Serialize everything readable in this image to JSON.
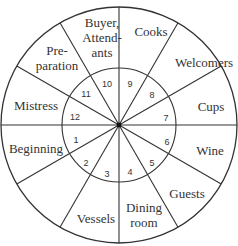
{
  "diagram": {
    "center": [
      119,
      125
    ],
    "outer_radius": 118,
    "inner_radius": 57,
    "line_color": "#333333",
    "sectors": [
      {
        "number": "1",
        "label": [
          "Beginning"
        ]
      },
      {
        "number": "2",
        "label": [
          "Vessels"
        ]
      },
      {
        "number": "3",
        "label": [
          ""
        ]
      },
      {
        "number": "4",
        "label": [
          "Dining",
          "room"
        ]
      },
      {
        "number": "5",
        "label": [
          "Guests"
        ]
      },
      {
        "number": "6",
        "label": [
          "Wine"
        ]
      },
      {
        "number": "7",
        "label": [
          "Cups"
        ]
      },
      {
        "number": "8",
        "label": [
          "Welcomers"
        ]
      },
      {
        "number": "9",
        "label": [
          "Cooks"
        ]
      },
      {
        "number": "10",
        "label": [
          "Buyer,",
          "Attend-",
          "ants"
        ]
      },
      {
        "number": "11",
        "label": [
          "Pre-",
          "paration"
        ]
      },
      {
        "number": "12",
        "label": [
          "Mistress"
        ]
      }
    ],
    "outer_labels": [
      {
        "text": [
          "Cooks"
        ],
        "x": 151,
        "y": 36
      },
      {
        "text": [
          "Welcomers"
        ],
        "x": 204,
        "y": 67
      },
      {
        "text": [
          "Cups"
        ],
        "x": 211,
        "y": 111
      },
      {
        "text": [
          "Wine"
        ],
        "x": 210,
        "y": 155
      },
      {
        "text": [
          "Guests"
        ],
        "x": 187,
        "y": 198
      },
      {
        "text": [
          "Dining",
          "room"
        ],
        "x": 144,
        "y": 212
      },
      {
        "text": [
          "Vessels"
        ],
        "x": 96,
        "y": 223
      },
      {
        "text": [
          "Beginning"
        ],
        "x": 36,
        "y": 153
      },
      {
        "text": [
          "Mistress"
        ],
        "x": 36,
        "y": 110
      },
      {
        "text": [
          "Pre-",
          "paration"
        ],
        "x": 57,
        "y": 55
      },
      {
        "text": [
          "Buyer,",
          "Attend-",
          "ants"
        ],
        "x": 102,
        "y": 27
      }
    ],
    "number_labels": [
      {
        "n": "1",
        "x": 76,
        "y": 143
      },
      {
        "n": "2",
        "x": 86,
        "y": 166
      },
      {
        "n": "3",
        "x": 107,
        "y": 177
      },
      {
        "n": "4",
        "x": 130,
        "y": 175
      },
      {
        "n": "5",
        "x": 152,
        "y": 166
      },
      {
        "n": "6",
        "x": 167,
        "y": 145
      },
      {
        "n": "7",
        "x": 166,
        "y": 121
      },
      {
        "n": "8",
        "x": 152,
        "y": 98
      },
      {
        "n": "9",
        "x": 130,
        "y": 87
      },
      {
        "n": "10",
        "x": 107,
        "y": 87
      },
      {
        "n": "11",
        "x": 86,
        "y": 97
      },
      {
        "n": "12",
        "x": 75,
        "y": 120
      }
    ]
  }
}
